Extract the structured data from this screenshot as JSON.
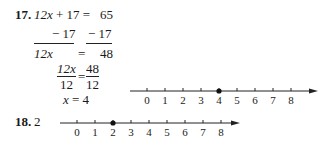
{
  "problem17": {
    "number": "17.",
    "line1": {
      "lhs": "12x + 17 =",
      "rhs": "65"
    },
    "line2": {
      "lhs": "− 17",
      "rhs": "− 17"
    },
    "line3": {
      "lhs": "12x",
      "eq": "=",
      "rhs": "48"
    },
    "fraction": {
      "lhs_num": "12x",
      "lhs_den": "12",
      "eq": "=",
      "rhs_num": "48",
      "rhs_den": "12"
    },
    "solution": "x = 4",
    "number_line": {
      "ticks": [
        "0",
        "1",
        "2",
        "3",
        "4",
        "5",
        "6",
        "7",
        "8"
      ],
      "point": 4
    }
  },
  "problem18": {
    "number": "18.",
    "answer": "2",
    "number_line": {
      "ticks": [
        "0",
        "1",
        "2",
        "3",
        "4",
        "5",
        "6",
        "7",
        "8"
      ],
      "point": 2
    }
  }
}
